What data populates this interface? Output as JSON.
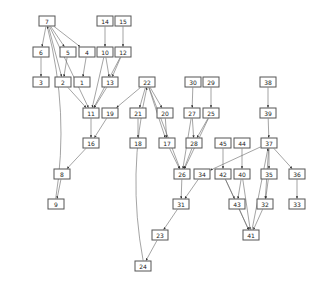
{
  "graph": {
    "nodes": [
      {
        "id": "7",
        "x": 47,
        "y": 21
      },
      {
        "id": "14",
        "x": 105,
        "y": 21
      },
      {
        "id": "15",
        "x": 123,
        "y": 21
      },
      {
        "id": "6",
        "x": 41,
        "y": 52
      },
      {
        "id": "5",
        "x": 68,
        "y": 52
      },
      {
        "id": "4",
        "x": 87,
        "y": 52
      },
      {
        "id": "10",
        "x": 105,
        "y": 52
      },
      {
        "id": "12",
        "x": 123,
        "y": 52
      },
      {
        "id": "3",
        "x": 41,
        "y": 82
      },
      {
        "id": "2",
        "x": 63,
        "y": 82
      },
      {
        "id": "1",
        "x": 82,
        "y": 82
      },
      {
        "id": "13",
        "x": 110,
        "y": 82
      },
      {
        "id": "22",
        "x": 147,
        "y": 82
      },
      {
        "id": "30",
        "x": 193,
        "y": 82
      },
      {
        "id": "29",
        "x": 211,
        "y": 82
      },
      {
        "id": "38",
        "x": 268,
        "y": 82
      },
      {
        "id": "11",
        "x": 91,
        "y": 113
      },
      {
        "id": "19",
        "x": 110,
        "y": 113
      },
      {
        "id": "21",
        "x": 138,
        "y": 113
      },
      {
        "id": "20",
        "x": 165,
        "y": 113
      },
      {
        "id": "27",
        "x": 192,
        "y": 113
      },
      {
        "id": "25",
        "x": 211,
        "y": 113
      },
      {
        "id": "39",
        "x": 268,
        "y": 113
      },
      {
        "id": "16",
        "x": 91,
        "y": 143
      },
      {
        "id": "18",
        "x": 138,
        "y": 143
      },
      {
        "id": "17",
        "x": 167,
        "y": 143
      },
      {
        "id": "28",
        "x": 194,
        "y": 143
      },
      {
        "id": "45",
        "x": 223,
        "y": 143
      },
      {
        "id": "44",
        "x": 242,
        "y": 143
      },
      {
        "id": "37",
        "x": 269,
        "y": 143
      },
      {
        "id": "8",
        "x": 62,
        "y": 174
      },
      {
        "id": "26",
        "x": 182,
        "y": 174
      },
      {
        "id": "34",
        "x": 202,
        "y": 174
      },
      {
        "id": "42",
        "x": 223,
        "y": 174
      },
      {
        "id": "40",
        "x": 242,
        "y": 174
      },
      {
        "id": "35",
        "x": 269,
        "y": 174
      },
      {
        "id": "36",
        "x": 297,
        "y": 174
      },
      {
        "id": "9",
        "x": 56,
        "y": 204
      },
      {
        "id": "31",
        "x": 181,
        "y": 204
      },
      {
        "id": "43",
        "x": 237,
        "y": 204
      },
      {
        "id": "32",
        "x": 265,
        "y": 204
      },
      {
        "id": "33",
        "x": 297,
        "y": 204
      },
      {
        "id": "23",
        "x": 160,
        "y": 235
      },
      {
        "id": "41",
        "x": 251,
        "y": 235
      },
      {
        "id": "24",
        "x": 143,
        "y": 266
      }
    ],
    "edges": [
      [
        "7",
        "6"
      ],
      [
        "7",
        "5"
      ],
      [
        "7",
        "4"
      ],
      [
        "7",
        "2"
      ],
      [
        "7",
        "11"
      ],
      [
        "9",
        "7"
      ],
      [
        "14",
        "10"
      ],
      [
        "15",
        "12"
      ],
      [
        "6",
        "3"
      ],
      [
        "5",
        "2"
      ],
      [
        "4",
        "1"
      ],
      [
        "10",
        "13"
      ],
      [
        "10",
        "11"
      ],
      [
        "12",
        "13"
      ],
      [
        "12",
        "11"
      ],
      [
        "2",
        "11"
      ],
      [
        "13",
        "11"
      ],
      [
        "11",
        "16"
      ],
      [
        "19",
        "16"
      ],
      [
        "16",
        "8"
      ],
      [
        "8",
        "9"
      ],
      [
        "22",
        "19"
      ],
      [
        "22",
        "21"
      ],
      [
        "22",
        "20"
      ],
      [
        "22",
        "17"
      ],
      [
        "22",
        "26"
      ],
      [
        "24",
        "22"
      ],
      [
        "21",
        "18"
      ],
      [
        "20",
        "17"
      ],
      [
        "17",
        "26"
      ],
      [
        "30",
        "27"
      ],
      [
        "29",
        "25"
      ],
      [
        "27",
        "28"
      ],
      [
        "27",
        "26"
      ],
      [
        "25",
        "28"
      ],
      [
        "25",
        "26"
      ],
      [
        "28",
        "26"
      ],
      [
        "26",
        "31"
      ],
      [
        "34",
        "31"
      ],
      [
        "31",
        "23"
      ],
      [
        "23",
        "24"
      ],
      [
        "38",
        "39"
      ],
      [
        "39",
        "37"
      ],
      [
        "37",
        "34"
      ],
      [
        "37",
        "35"
      ],
      [
        "37",
        "36"
      ],
      [
        "37",
        "32"
      ],
      [
        "41",
        "37"
      ],
      [
        "45",
        "42"
      ],
      [
        "44",
        "40"
      ],
      [
        "42",
        "43"
      ],
      [
        "42",
        "41"
      ],
      [
        "40",
        "43"
      ],
      [
        "40",
        "41"
      ],
      [
        "35",
        "32"
      ],
      [
        "36",
        "33"
      ],
      [
        "43",
        "41"
      ],
      [
        "32",
        "41"
      ]
    ]
  }
}
